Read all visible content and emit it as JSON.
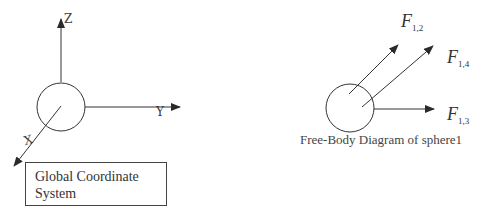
{
  "global_frame": {
    "axes": {
      "z": "Z",
      "y": "Y",
      "x": "X"
    },
    "box_line1": "Global Coordinate",
    "box_line2": "System"
  },
  "free_body": {
    "caption": "Free-Body Diagram of sphere1",
    "forces": [
      {
        "symbol": "F",
        "subscript": "1,2"
      },
      {
        "symbol": "F",
        "subscript": "1,4"
      },
      {
        "symbol": "F",
        "subscript": "1,3"
      }
    ]
  },
  "colors": {
    "stroke": "#333333",
    "background": "#ffffff"
  }
}
